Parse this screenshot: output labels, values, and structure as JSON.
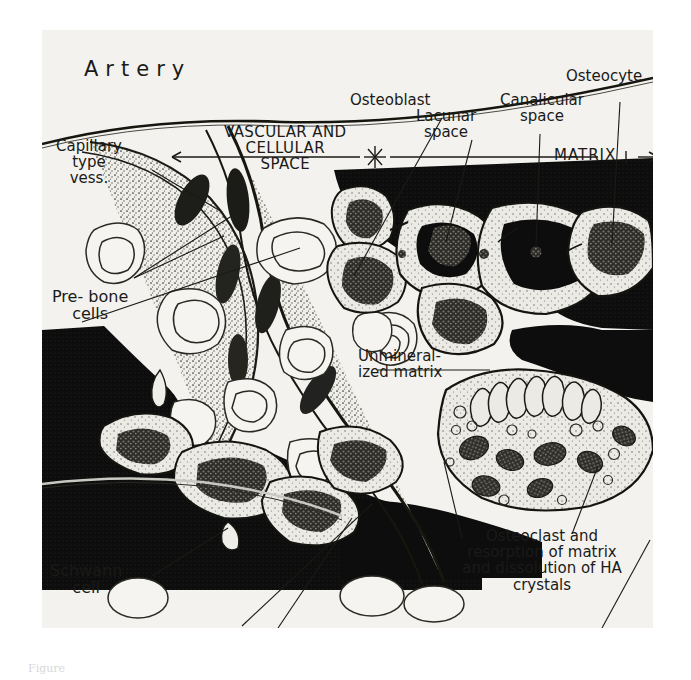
{
  "figure": {
    "type": "scientific-illustration",
    "background_color": "#f3f2ee",
    "ink_color": "#1a1a18",
    "matrix_color": "#0d0d0d",
    "clipped_caption": "Figure"
  },
  "labels": {
    "artery": "Artery",
    "capillary": "Capillary\ntype\nvess.",
    "prebone": "Pre- bone\ncells",
    "vascular_space": "VASCULAR AND\nCELLULAR\nSPACE",
    "osteoblast": "Osteoblast",
    "lacunar": "Lacunar\nspace",
    "canalicular": "Canalicular\nspace",
    "osteocyte": "Osteocyte",
    "matrix": "MATRIX",
    "unmineralized": "Unmineral-\nized matrix",
    "osteoclast": "Osteoclast and\nresorption of matrix\nand dissolution of HA\ncrystals",
    "schwann": "Schwann\ncell"
  },
  "axis": {
    "boundary_marker": "*",
    "left_arrow": "←",
    "right_arrow": "→"
  }
}
